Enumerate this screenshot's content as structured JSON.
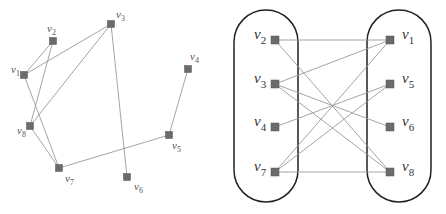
{
  "figure": {
    "width": 446,
    "height": 214,
    "colors": {
      "node_fill": "#6b6b6b",
      "node_stroke": "#555555",
      "edge": "#9a9a9a",
      "group_outline": "#222222",
      "label_left": "#555555",
      "label_right": "#333333"
    }
  },
  "left_graph": {
    "name": "graph-drawing",
    "node_size": 7,
    "label_size": 11,
    "nodes": [
      {
        "id": "v1",
        "base": "v",
        "sub": "1",
        "x": 24,
        "y": 75,
        "lx": 11,
        "ly": 73
      },
      {
        "id": "v2",
        "base": "v",
        "sub": "2",
        "x": 53,
        "y": 41,
        "lx": 47,
        "ly": 32
      },
      {
        "id": "v3",
        "base": "v",
        "sub": "3",
        "x": 111,
        "y": 24,
        "lx": 116,
        "ly": 18
      },
      {
        "id": "v4",
        "base": "v",
        "sub": "4",
        "x": 188,
        "y": 69,
        "lx": 190,
        "ly": 60
      },
      {
        "id": "v5",
        "base": "v",
        "sub": "5",
        "x": 169,
        "y": 135,
        "lx": 172,
        "ly": 149
      },
      {
        "id": "v6",
        "base": "v",
        "sub": "6",
        "x": 127,
        "y": 177,
        "lx": 134,
        "ly": 190
      },
      {
        "id": "v7",
        "base": "v",
        "sub": "7",
        "x": 59,
        "y": 168,
        "lx": 65,
        "ly": 182
      },
      {
        "id": "v8",
        "base": "v",
        "sub": "8",
        "x": 30,
        "y": 126,
        "lx": 17,
        "ly": 134
      }
    ],
    "edges": [
      [
        "v1",
        "v2"
      ],
      [
        "v1",
        "v3"
      ],
      [
        "v1",
        "v7"
      ],
      [
        "v2",
        "v8"
      ],
      [
        "v3",
        "v8"
      ],
      [
        "v3",
        "v6"
      ],
      [
        "v8",
        "v7"
      ],
      [
        "v7",
        "v5"
      ],
      [
        "v5",
        "v4"
      ]
    ]
  },
  "right_graph": {
    "name": "bipartite-drawing",
    "node_size": 8,
    "label_size": 15,
    "groups": [
      {
        "id": "left-partition",
        "x": 234,
        "y": 10,
        "w": 64,
        "h": 192,
        "r": 32
      },
      {
        "id": "right-partition",
        "x": 367,
        "y": 10,
        "w": 64,
        "h": 192,
        "r": 32
      }
    ],
    "nodes": [
      {
        "id": "v2",
        "base": "v",
        "sub": "2",
        "x": 275,
        "y": 40,
        "lx": 254,
        "ly": 39
      },
      {
        "id": "v3",
        "base": "v",
        "sub": "3",
        "x": 275,
        "y": 84,
        "lx": 254,
        "ly": 83
      },
      {
        "id": "v4",
        "base": "v",
        "sub": "4",
        "x": 275,
        "y": 127,
        "lx": 254,
        "ly": 126
      },
      {
        "id": "v7",
        "base": "v",
        "sub": "7",
        "x": 275,
        "y": 172,
        "lx": 254,
        "ly": 171
      },
      {
        "id": "v1",
        "base": "v",
        "sub": "1",
        "x": 390,
        "y": 40,
        "lx": 402,
        "ly": 39
      },
      {
        "id": "v5",
        "base": "v",
        "sub": "5",
        "x": 390,
        "y": 84,
        "lx": 402,
        "ly": 83
      },
      {
        "id": "v6",
        "base": "v",
        "sub": "6",
        "x": 390,
        "y": 127,
        "lx": 402,
        "ly": 126
      },
      {
        "id": "v8",
        "base": "v",
        "sub": "8",
        "x": 390,
        "y": 172,
        "lx": 402,
        "ly": 171
      }
    ],
    "edges": [
      [
        "v2",
        "v1"
      ],
      [
        "v2",
        "v8"
      ],
      [
        "v3",
        "v1"
      ],
      [
        "v3",
        "v6"
      ],
      [
        "v3",
        "v8"
      ],
      [
        "v4",
        "v5"
      ],
      [
        "v7",
        "v1"
      ],
      [
        "v7",
        "v5"
      ],
      [
        "v7",
        "v8"
      ]
    ]
  }
}
